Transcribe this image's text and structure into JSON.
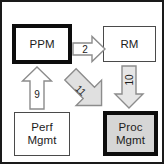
{
  "diagram": {
    "canvas": {
      "width": 164,
      "height": 164,
      "background": "#ffffff",
      "frame_color": "#1a1a1a"
    },
    "nodes": [
      {
        "id": "ppm",
        "label": "PPM",
        "label_lines": [
          "PPM"
        ],
        "position": "top-left",
        "border": "thick",
        "border_color": "#0d0d0d",
        "fill": "#ffffff"
      },
      {
        "id": "rm",
        "label": "RM",
        "label_lines": [
          "RM"
        ],
        "position": "top-right",
        "border": "thin",
        "border_color": "#4a4a4a",
        "fill": "#ffffff"
      },
      {
        "id": "perf",
        "label": "Perf Mgmt",
        "label_lines": [
          "Perf",
          "Mgmt"
        ],
        "position": "bottom-left",
        "border": "thin",
        "border_color": "#4a4a4a",
        "fill": "#ffffff"
      },
      {
        "id": "proc",
        "label": "Proc Mgmt",
        "label_lines": [
          "Proc",
          "Mgmt"
        ],
        "position": "bottom-right",
        "border": "thick",
        "border_color": "#0d0d0d",
        "fill": "#d6d6d6"
      }
    ],
    "arrows": [
      {
        "id": "arrow-2",
        "label": "2",
        "from": "ppm",
        "to": "rm",
        "direction": "right",
        "fill": "#ffffff",
        "stroke": "#8c8c8c"
      },
      {
        "id": "arrow-10",
        "label": "10",
        "from": "rm",
        "to": "proc",
        "direction": "down",
        "label_rotation": -90,
        "fill": "#e6e6e6",
        "stroke": "#8c8c8c"
      },
      {
        "id": "arrow-9",
        "label": "9",
        "from": "perf",
        "to": "ppm",
        "direction": "up",
        "fill": "#ffffff",
        "stroke": "#8c8c8c"
      },
      {
        "id": "arrow-11",
        "label": "11",
        "from": "ppm",
        "to": "proc",
        "direction": "diagonal-down-right",
        "label_rotation": 45,
        "fill": "#e0e0e0",
        "stroke": "#8c8c8c"
      }
    ]
  }
}
